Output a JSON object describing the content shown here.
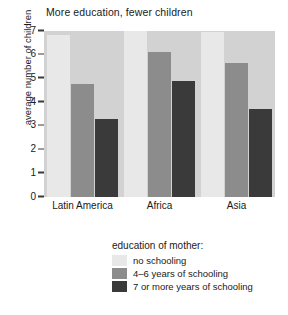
{
  "chart_data": {
    "type": "bar",
    "title": "More education, fewer children",
    "xlabel": "",
    "ylabel": "average number of children",
    "categories": [
      "Latin America",
      "Africa",
      "Asia"
    ],
    "ylim": [
      0,
      7
    ],
    "yticks": [
      0,
      1,
      2,
      3,
      4,
      5,
      6,
      7
    ],
    "grid": false,
    "legend_position": "below",
    "legend_title": "education of mother:",
    "series": [
      {
        "name": "no schooling",
        "color": "#e8e8e8",
        "values": [
          6.85,
          7.0,
          6.95
        ]
      },
      {
        "name": "4–6 years of schooling",
        "color": "#8c8c8c",
        "values": [
          4.75,
          6.1,
          5.65
        ]
      },
      {
        "name": "7 or more years of schooling",
        "color": "#3a3a3a",
        "values": [
          3.3,
          4.9,
          3.7
        ]
      }
    ],
    "plot_background": "#d2d2d2"
  }
}
